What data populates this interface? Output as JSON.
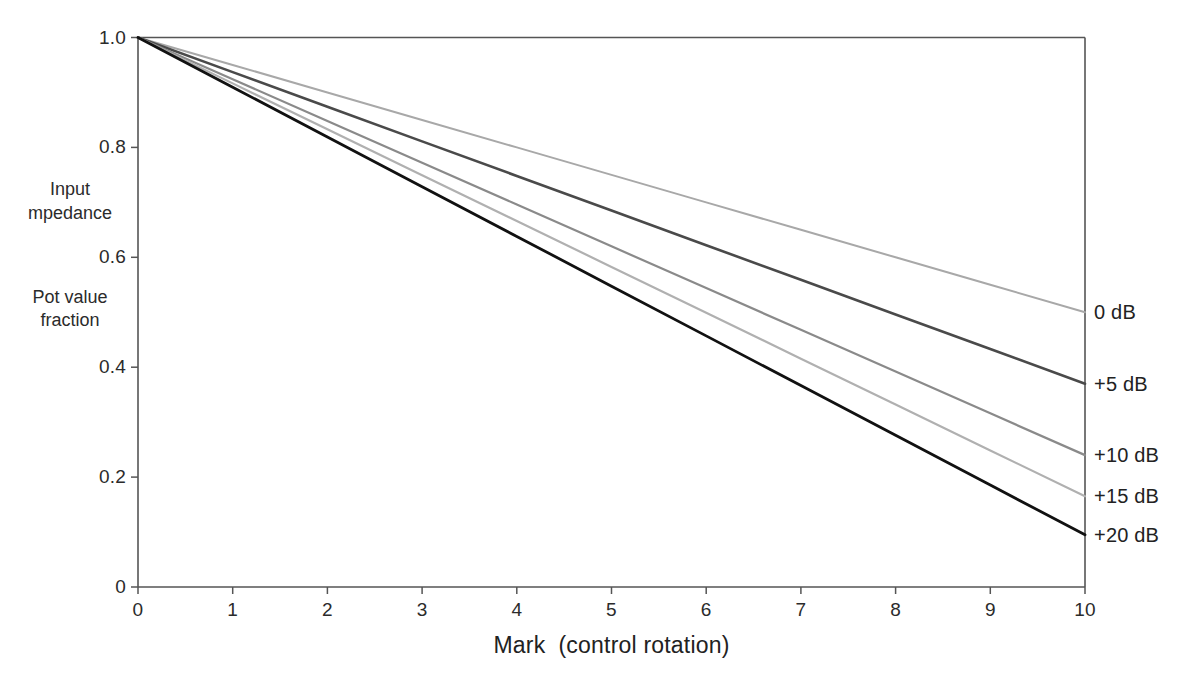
{
  "chart_data": {
    "type": "line",
    "title": "",
    "xlabel": "Mark  (control rotation)",
    "ylabel_top": "Input\nmpedance",
    "ylabel_bottom": "Pot value\nfraction",
    "xlim": [
      0,
      10
    ],
    "ylim": [
      0,
      1.0
    ],
    "grid": false,
    "legend_position": "right-inline-end-of-line",
    "xticks": [
      "0",
      "1",
      "2",
      "3",
      "4",
      "5",
      "6",
      "7",
      "8",
      "9",
      "10"
    ],
    "xtick_values": [
      0,
      1,
      2,
      3,
      4,
      5,
      6,
      7,
      8,
      9,
      10
    ],
    "yticks": [
      "0",
      "0.2",
      "0.4",
      "0.6",
      "0.8",
      "1.0"
    ],
    "ytick_values": [
      0,
      0.2,
      0.4,
      0.6,
      0.8,
      1.0
    ],
    "x": [
      0,
      1,
      2,
      3,
      4,
      5,
      6,
      7,
      8,
      9,
      10
    ],
    "series": [
      {
        "name": "0 dB",
        "color": "#a8a8a8",
        "width": 2.0,
        "values": [
          1.0,
          0.95,
          0.9,
          0.85,
          0.8,
          0.75,
          0.7,
          0.65,
          0.6,
          0.55,
          0.5
        ]
      },
      {
        "name": "+5 dB",
        "color": "#4a4a4a",
        "width": 2.6,
        "values": [
          1.0,
          0.937,
          0.874,
          0.811,
          0.748,
          0.685,
          0.622,
          0.559,
          0.496,
          0.433,
          0.37
        ]
      },
      {
        "name": "+10 dB",
        "color": "#8a8a8a",
        "width": 2.2,
        "values": [
          1.0,
          0.924,
          0.848,
          0.772,
          0.696,
          0.62,
          0.544,
          0.468,
          0.392,
          0.316,
          0.24
        ]
      },
      {
        "name": "+15 dB",
        "color": "#b0b0b0",
        "width": 2.2,
        "values": [
          1.0,
          0.9165,
          0.833,
          0.7495,
          0.666,
          0.5825,
          0.499,
          0.4155,
          0.332,
          0.2485,
          0.165
        ]
      },
      {
        "name": "+20 dB",
        "color": "#111111",
        "width": 2.8,
        "values": [
          1.0,
          0.9095,
          0.819,
          0.7285,
          0.638,
          0.5475,
          0.457,
          0.3665,
          0.276,
          0.1855,
          0.095
        ]
      }
    ]
  },
  "axis_captions": {
    "top_line1": "Input",
    "top_line2": "mpedance",
    "bottom_line1": "Pot value",
    "bottom_line2": "fraction"
  },
  "colors": {
    "frame": "#555555",
    "text": "#222222",
    "background": "#ffffff"
  }
}
